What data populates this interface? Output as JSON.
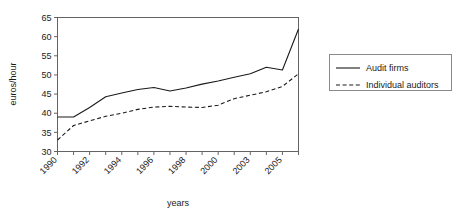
{
  "chart_data": {
    "type": "line",
    "title": "",
    "xlabel": "years",
    "ylabel": "euros/hour",
    "ylim": [
      30,
      65
    ],
    "ytick_step": 5,
    "yticks": [
      30,
      35,
      40,
      45,
      50,
      55,
      60,
      65
    ],
    "grid": false,
    "legend_position": "right",
    "x": [
      "1990",
      "1991",
      "1992",
      "1993",
      "1994",
      "1995",
      "1996",
      "1997",
      "1998",
      "1999",
      "2000",
      "2001",
      "2002",
      "2003",
      "2004",
      "2005"
    ],
    "xtick_labels_shown": [
      "1990",
      "1992",
      "1994",
      "1996",
      "1998",
      "2000",
      "2003",
      "2005"
    ],
    "xtick_label_interval": 2,
    "series": [
      {
        "name": "Audit firms",
        "style": "solid",
        "color": "#1a1a1a",
        "values": [
          39.0,
          39.0,
          41.5,
          44.3,
          45.3,
          46.2,
          46.7,
          45.8,
          46.6,
          47.6,
          48.4,
          49.4,
          50.3,
          52.0,
          51.3,
          62.0
        ]
      },
      {
        "name": "Individual auditors",
        "style": "dashed",
        "color": "#1a1a1a",
        "values": [
          33.0,
          36.8,
          38.0,
          39.2,
          40.0,
          41.0,
          41.6,
          41.8,
          41.6,
          41.5,
          42.1,
          43.8,
          44.7,
          45.6,
          47.0,
          50.3
        ]
      }
    ]
  },
  "legend": {
    "items": [
      {
        "label": "Audit firms",
        "style": "solid"
      },
      {
        "label": "Individual auditors",
        "style": "dashed"
      }
    ]
  },
  "axes": {
    "y_title": "euros/hour",
    "x_title": "years"
  }
}
